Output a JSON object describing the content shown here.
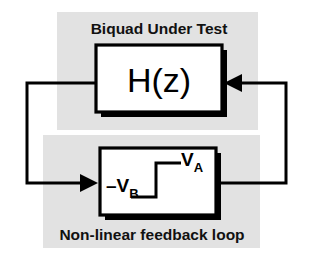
{
  "figure": {
    "title": "Biquad Under Test",
    "bottom_caption": "Non-linear feedback loop",
    "forward_block": {
      "label": "H(z)",
      "name": "biquad-transfer-function"
    },
    "feedback_block": {
      "name": "non-linear-relay",
      "high_level_symbol": "V",
      "high_level_subscript": "A",
      "low_level_symbol": "–V",
      "low_level_subscript": "B",
      "characteristic": "two-level step / relay"
    },
    "colors": {
      "panel_shade": "#e2e2e2",
      "line": "#000000",
      "block_fill": "#ffffff",
      "background": "#ffffff"
    },
    "wires": [
      {
        "name": "forward-output-to-feedback-input",
        "from": "H(z) left edge",
        "to": "non-linear block left input",
        "arrow": "right"
      },
      {
        "name": "feedback-output-to-forward-input",
        "from": "non-linear block right edge",
        "to": "H(z) right edge",
        "arrow": "left"
      }
    ]
  }
}
